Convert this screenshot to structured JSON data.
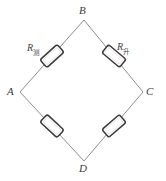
{
  "figure": {
    "type": "circuit-diagram",
    "shape": "rhombus",
    "width": 166,
    "height": 181,
    "background_color": "#ffffff",
    "wire_color": "#8d8d8d",
    "component_outline_color": "#3a3a3a",
    "component_fill_color": "#ffffff",
    "label_color": "#3b3b3b"
  },
  "vertices": [
    {
      "id": "A",
      "label": "A",
      "position": "left",
      "x": 20,
      "y": 92
    },
    {
      "id": "B",
      "label": "B",
      "position": "top",
      "x": 84,
      "y": 20
    },
    {
      "id": "C",
      "label": "C",
      "position": "right",
      "x": 143,
      "y": 92
    },
    {
      "id": "D",
      "label": "D",
      "position": "bottom",
      "x": 84,
      "y": 161
    }
  ],
  "edges": [
    {
      "id": "AB",
      "from": "A",
      "to": "B",
      "has_resistor": true
    },
    {
      "id": "BC",
      "from": "B",
      "to": "C",
      "has_resistor": true
    },
    {
      "id": "AD",
      "from": "A",
      "to": "D",
      "has_resistor": true
    },
    {
      "id": "DC",
      "from": "D",
      "to": "C",
      "has_resistor": true
    }
  ],
  "resistors": [
    {
      "id": "R-ab",
      "edge": "AB",
      "labeled": true,
      "label_base": "R",
      "label_subscript": "测",
      "label_full": "R测",
      "cx": 52,
      "cy": 56
    },
    {
      "id": "R-bc",
      "edge": "BC",
      "labeled": true,
      "label_base": "R",
      "label_subscript": "升",
      "label_full": "R升",
      "cx": 114,
      "cy": 56
    },
    {
      "id": "R-ad",
      "edge": "AD",
      "labeled": false,
      "label_full": "",
      "cx": 52,
      "cy": 126
    },
    {
      "id": "R-dc",
      "edge": "DC",
      "labeled": false,
      "label_full": "",
      "cx": 114,
      "cy": 126
    }
  ]
}
